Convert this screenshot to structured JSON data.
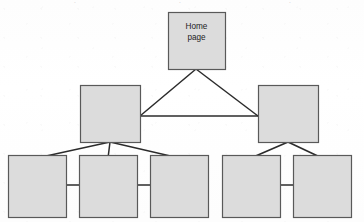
{
  "diagram": {
    "type": "site-map-hierarchy",
    "title_fragment_top": "",
    "colors": {
      "box_fill": "#dcdcdc",
      "box_stroke": "#595959",
      "connector": "#2b2b2b",
      "background": "#fefefe",
      "label_text": "#1d1d1d"
    },
    "nodes": [
      {
        "id": "home",
        "level": 0,
        "label_line1": "Home",
        "label_line2": "page",
        "x": 168,
        "y": 12,
        "w": 57,
        "h": 57
      },
      {
        "id": "mid-left",
        "level": 1,
        "label_line1": "",
        "label_line2": "",
        "x": 80,
        "y": 85,
        "w": 60,
        "h": 57
      },
      {
        "id": "mid-right",
        "level": 1,
        "label_line1": "",
        "label_line2": "",
        "x": 258,
        "y": 85,
        "w": 60,
        "h": 57
      },
      {
        "id": "leaf-1",
        "level": 2,
        "label_line1": "",
        "label_line2": "",
        "x": 8,
        "y": 155,
        "w": 58,
        "h": 62
      },
      {
        "id": "leaf-2",
        "level": 2,
        "label_line1": "",
        "label_line2": "",
        "x": 79,
        "y": 155,
        "w": 58,
        "h": 62
      },
      {
        "id": "leaf-3",
        "level": 2,
        "label_line1": "",
        "label_line2": "",
        "x": 150,
        "y": 155,
        "w": 58,
        "h": 62
      },
      {
        "id": "leaf-4",
        "level": 2,
        "label_line1": "",
        "label_line2": "",
        "x": 222,
        "y": 155,
        "w": 58,
        "h": 62
      },
      {
        "id": "leaf-5",
        "level": 2,
        "label_line1": "",
        "label_line2": "",
        "x": 293,
        "y": 155,
        "w": 58,
        "h": 62
      }
    ],
    "connectors": [
      {
        "id": "home-to-mid-left",
        "kind": "diagonal",
        "x1": 196,
        "y1": 69,
        "x2": 140,
        "y2": 116
      },
      {
        "id": "home-to-mid-right",
        "kind": "diagonal",
        "x1": 196,
        "y1": 69,
        "x2": 258,
        "y2": 116
      },
      {
        "id": "mid-left-to-mid-right",
        "kind": "horizontal",
        "x1": 140,
        "y1": 116,
        "x2": 258,
        "y2": 116
      },
      {
        "id": "mid-left-to-leaf-1",
        "kind": "diagonal",
        "x1": 110,
        "y1": 142,
        "x2": 37,
        "y2": 158
      },
      {
        "id": "mid-left-to-leaf-2",
        "kind": "vertical",
        "x1": 110,
        "y1": 142,
        "x2": 108,
        "y2": 158
      },
      {
        "id": "mid-left-to-leaf-3",
        "kind": "diagonal",
        "x1": 110,
        "y1": 142,
        "x2": 179,
        "y2": 158
      },
      {
        "id": "mid-right-to-leaf-4",
        "kind": "diagonal",
        "x1": 288,
        "y1": 142,
        "x2": 251,
        "y2": 158
      },
      {
        "id": "mid-right-to-leaf-5",
        "kind": "diagonal",
        "x1": 288,
        "y1": 142,
        "x2": 322,
        "y2": 158
      },
      {
        "id": "leaf-1-to-leaf-2",
        "kind": "horizontal",
        "x1": 66,
        "y1": 185,
        "x2": 79,
        "y2": 185
      },
      {
        "id": "leaf-2-to-leaf-3",
        "kind": "horizontal",
        "x1": 137,
        "y1": 185,
        "x2": 150,
        "y2": 185
      },
      {
        "id": "leaf-4-to-leaf-5",
        "kind": "horizontal",
        "x1": 280,
        "y1": 185,
        "x2": 293,
        "y2": 185
      }
    ],
    "cut_off_top_marks": [
      {
        "id": "mark-left",
        "text": "·",
        "x": 75,
        "y": 5
      },
      {
        "id": "mark-center",
        "text": "·",
        "x": 180,
        "y": 5
      },
      {
        "id": "mark-right",
        "text": "·",
        "x": 290,
        "y": 5
      }
    ]
  }
}
